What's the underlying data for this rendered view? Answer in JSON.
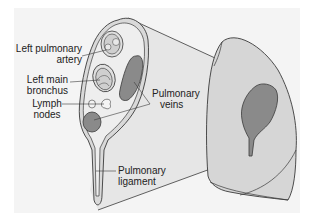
{
  "diagram": {
    "colors": {
      "background": "#ffffff",
      "panel": "#f4f4f4",
      "lung_fill": "#d6d6d6",
      "projection_fill": "#e4e4e4",
      "vein_fill": "#8a8a8a",
      "outline": "#3a3a3a"
    },
    "labels": {
      "left_pulmonary_artery_1": "Left pulmonary",
      "left_pulmonary_artery_2": "artery",
      "left_main_bronchus_1": "Left main",
      "left_main_bronchus_2": "bronchus",
      "lymph_nodes_1": "Lymph",
      "lymph_nodes_2": "nodes",
      "pulmonary_veins_1": "Pulmonary",
      "pulmonary_veins_2": "veins",
      "pulmonary_ligament_1": "Pulmonary",
      "pulmonary_ligament_2": "ligament"
    },
    "structures": [
      "left-pulmonary-artery",
      "left-main-bronchus",
      "lymph-nodes",
      "pulmonary-veins",
      "pulmonary-ligament",
      "left-lung-medial-surface",
      "hilum"
    ]
  }
}
